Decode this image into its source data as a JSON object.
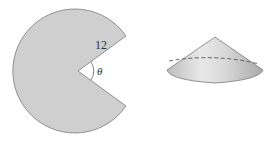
{
  "figure": {
    "sector": {
      "radius_label": "12",
      "angle_label": "θ",
      "fill_color": "#cfcfcf",
      "stroke_color": "#7a7a7a"
    },
    "cone": {
      "fill_color": "#d6d6d6",
      "stroke_color": "#7a7a7a",
      "dashed_line": true
    }
  }
}
